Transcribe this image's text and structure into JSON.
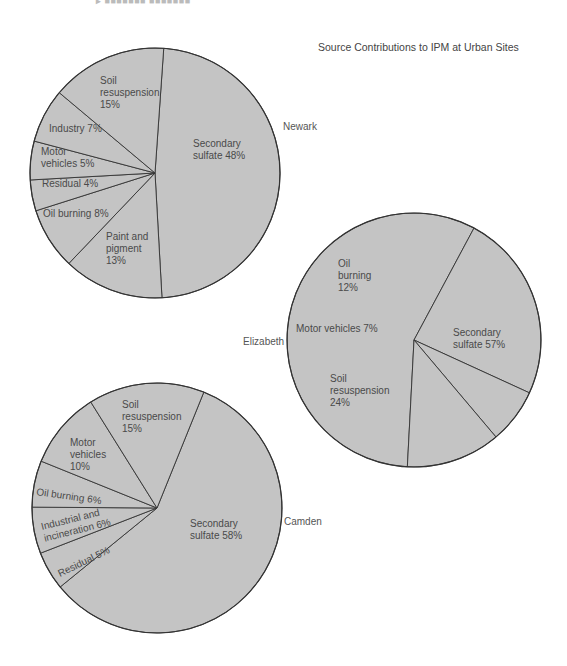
{
  "page": {
    "header_fragment": "▸ ■■■■■■■ ■■■■■■■",
    "title": "Source Contributions to IPM at Urban Sites"
  },
  "chart_data": {
    "type": "pie",
    "title": "Source Contributions to IPM at Urban Sites",
    "charts": [
      {
        "site": "Newark",
        "cx": 155,
        "cy": 173,
        "r": 125,
        "site_label_pos": [
          283,
          130
        ],
        "slices": [
          {
            "label": "Secondary sulfate",
            "value": 48,
            "lines": [
              "Secondary",
              "sulfate 48%"
            ],
            "pos": [
              193,
              147
            ]
          },
          {
            "label": "Paint and pigment",
            "value": 13,
            "lines": [
              "Paint and",
              "pigment",
              "13%"
            ],
            "pos": [
              106,
              240
            ]
          },
          {
            "label": "Oil burning",
            "value": 8,
            "lines": [
              "Oil burning 8%"
            ],
            "pos": [
              43,
              217
            ]
          },
          {
            "label": "Residual",
            "value": 4,
            "lines": [
              "Residual 4%"
            ],
            "pos": [
              42,
              187
            ]
          },
          {
            "label": "Motor vehicles",
            "value": 5,
            "lines": [
              "Motor",
              "vehicles 5%"
            ],
            "pos": [
              41,
              155
            ]
          },
          {
            "label": "Industry",
            "value": 7,
            "lines": [
              "Industry 7%"
            ],
            "pos": [
              49,
              132
            ]
          },
          {
            "label": "Soil resuspension",
            "value": 15,
            "lines": [
              "Soil",
              "resuspension",
              "15%"
            ],
            "pos": [
              100,
              84
            ]
          }
        ]
      },
      {
        "site": "Elizabeth",
        "cx": 414,
        "cy": 340,
        "r": 127,
        "site_label_pos": [
          243,
          345
        ],
        "slices": [
          {
            "label": "Secondary sulfate",
            "value": 57,
            "lines": [
              "Secondary",
              "sulfate 57%"
            ],
            "pos": [
              453,
              336
            ]
          },
          {
            "label": "Soil resuspension",
            "value": 24,
            "lines": [
              "Soil",
              "resuspension",
              "24%"
            ],
            "pos": [
              330,
              382
            ]
          },
          {
            "label": "Motor vehicles",
            "value": 7,
            "lines": [
              "Motor vehicles 7%"
            ],
            "pos": [
              296,
              332
            ]
          },
          {
            "label": "Oil burning",
            "value": 12,
            "lines": [
              "Oil",
              "burning",
              "12%"
            ],
            "pos": [
              338,
              267
            ]
          }
        ]
      },
      {
        "site": "Camden",
        "cx": 157,
        "cy": 508,
        "r": 125,
        "site_label_pos": [
          284,
          525
        ],
        "slices": [
          {
            "label": "Secondary sulfate",
            "value": 58,
            "lines": [
              "Secondary",
              "sulfate 58%"
            ],
            "pos": [
              190,
              527
            ]
          },
          {
            "label": "Residual",
            "value": 5,
            "lines": [
              "Residual 5%"
            ],
            "pos": [
              60,
              577
            ],
            "rotate": -26
          },
          {
            "label": "Industrial and incineration",
            "value": 6,
            "lines": [
              "Industrial and",
              "incineration 6%"
            ],
            "pos": [
              42,
              530
            ],
            "rotate": -14
          },
          {
            "label": "Oil burning",
            "value": 6,
            "lines": [
              "Oil burning 6%"
            ],
            "pos": [
              36,
              495
            ],
            "rotate": 8
          },
          {
            "label": "Motor vehicles",
            "value": 10,
            "lines": [
              "Motor",
              "vehicles",
              "10%"
            ],
            "pos": [
              70,
              446
            ]
          },
          {
            "label": "Soil resuspension",
            "value": 15,
            "lines": [
              "Soil",
              "resuspension",
              "15%"
            ],
            "pos": [
              122,
              408
            ]
          }
        ]
      }
    ]
  }
}
